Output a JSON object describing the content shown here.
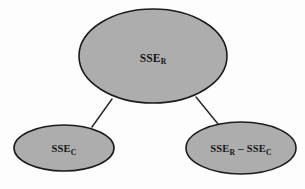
{
  "diagram": {
    "type": "venn-decomposition-tree",
    "background_color": "#fdfdfd",
    "node_fill_color": "#adadad",
    "node_stroke_color": "#1c1c1c",
    "label_color": "#141414",
    "nodes": [
      {
        "id": "sse-r",
        "role": "root",
        "label_base": "SSE",
        "label_subscript": "R",
        "label_text": "SSE_R",
        "shape": "ellipse",
        "cx": 153,
        "cy": 56,
        "rx": 74,
        "ry": 47
      },
      {
        "id": "sse-c",
        "role": "child-left",
        "label_base": "SSE",
        "label_subscript": "C",
        "label_text": "SSE_C",
        "shape": "ellipse",
        "cx": 64,
        "cy": 148,
        "rx": 50,
        "ry": 23
      },
      {
        "id": "sse-r-minus-sse-c",
        "role": "child-right",
        "label_base_1": "SSE",
        "label_subscript_1": "R",
        "label_operator": "–",
        "label_base_2": "SSE",
        "label_subscript_2": "C",
        "label_text": "SSE_R – SSE_C",
        "shape": "ellipse",
        "cx": 241,
        "cy": 148,
        "rx": 55,
        "ry": 26
      }
    ],
    "edges": [
      {
        "id": "edge-root-to-left",
        "from": "sse-r",
        "to": "sse-c",
        "x1": 112,
        "y1": 99,
        "x2": 92,
        "y2": 127
      },
      {
        "id": "edge-root-to-right",
        "from": "sse-r",
        "to": "sse-r-minus-sse-c",
        "x1": 196,
        "y1": 97,
        "x2": 218,
        "y2": 124
      }
    ]
  }
}
